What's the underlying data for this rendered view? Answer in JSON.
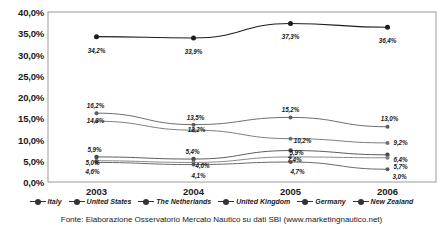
{
  "chart_data": {
    "type": "line",
    "title": "",
    "xlabel": "",
    "ylabel": "",
    "x": [
      "2003",
      "2004",
      "2005",
      "2006"
    ],
    "categories": [
      "2003",
      "2004",
      "2005",
      "2006"
    ],
    "ylim": [
      0,
      40
    ],
    "ytick_labels": [
      "0,0%",
      "5,0%",
      "10,0%",
      "15,0%",
      "20,0%",
      "25,0%",
      "30,0%",
      "35,0%",
      "40,0%"
    ],
    "ytick_values": [
      0,
      5,
      10,
      15,
      20,
      25,
      30,
      35,
      40
    ],
    "grid": false,
    "legend_position": "bottom",
    "series": [
      {
        "name": "Italy",
        "values": [
          34.2,
          33.9,
          37.3,
          36.4
        ],
        "labels": [
          "34,2%",
          "33,9%",
          "37,3%",
          "36,4%"
        ]
      },
      {
        "name": "United States",
        "values": [
          16.2,
          13.5,
          15.2,
          13.0
        ],
        "labels": [
          "16,2%",
          "13,5%",
          "15,2%",
          "13,0%"
        ]
      },
      {
        "name": "The Netherlands",
        "values": [
          14.3,
          12.2,
          10.2,
          9.2
        ],
        "labels": [
          "14,3%",
          "12,2%",
          "10,2%",
          "9,2%"
        ]
      },
      {
        "name": "United Kingdom",
        "values": [
          5.9,
          5.4,
          7.4,
          6.4
        ],
        "labels": [
          "5,9%",
          "5,4%",
          "7,4%",
          "6,4%"
        ]
      },
      {
        "name": "Germany",
        "values": [
          5.0,
          4.6,
          5.9,
          5.7
        ],
        "labels": [
          "5,0%",
          "4,6%",
          "5,9%",
          "5,7%"
        ]
      },
      {
        "name": "New Zealand",
        "values": [
          4.6,
          4.1,
          4.7,
          3.0
        ],
        "labels": [
          "4,6%",
          "4,1%",
          "4,7%",
          "3,0%"
        ]
      }
    ]
  },
  "legend": {
    "items": [
      {
        "label": "Italy"
      },
      {
        "label": "United States"
      },
      {
        "label": "The Netherlands"
      },
      {
        "label": "United Kingdom"
      },
      {
        "label": "Germany"
      },
      {
        "label": "New Zealand"
      }
    ]
  },
  "source": {
    "text": "Fonte: Elaborazione Osservatorio Mercato Nautico su dati SBI (www.marketingnautico.net)"
  }
}
